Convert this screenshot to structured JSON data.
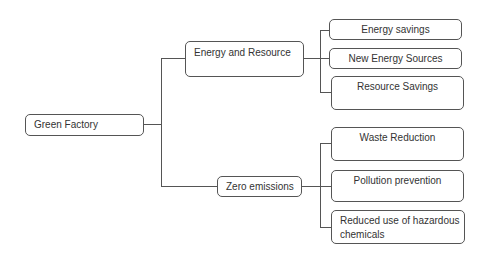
{
  "diagram": {
    "type": "tree",
    "root": {
      "label": "Green Factory",
      "children": [
        {
          "label": "Energy and Resource",
          "children": [
            {
              "label": "Energy savings"
            },
            {
              "label": "New Energy Sources"
            },
            {
              "label": "Resource Savings"
            }
          ]
        },
        {
          "label": "Zero emissions",
          "children": [
            {
              "label": "Waste Reduction"
            },
            {
              "label": "Pollution prevention"
            },
            {
              "label": "Reduced use of hazardous chemicals"
            }
          ]
        }
      ]
    },
    "colors": {
      "line": "#555555",
      "text": "#333333",
      "background": "#ffffff"
    }
  }
}
